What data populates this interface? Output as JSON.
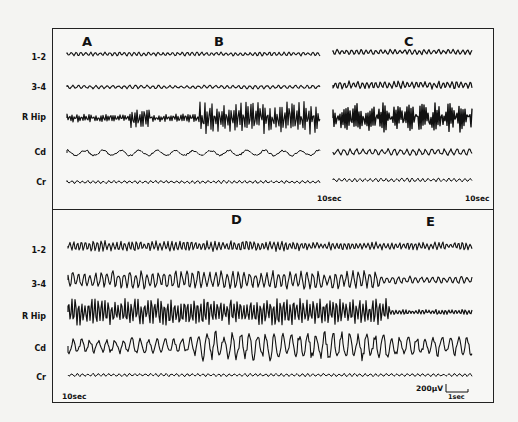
{
  "figure": {
    "top_panel": {
      "section_labels": [
        "A",
        "B",
        "C"
      ],
      "channels": [
        "1-2",
        "3-4",
        "R Hip",
        "Cd",
        "Cr"
      ],
      "time_marks": [
        "10sec",
        "10sec"
      ]
    },
    "bottom_panel": {
      "section_labels": [
        "D",
        "E"
      ],
      "channels": [
        "1-2",
        "3-4",
        "R Hip",
        "Cd",
        "Cr"
      ],
      "time_mark": "10sec",
      "calibration": {
        "amplitude": "200µV",
        "time": "1sec"
      }
    }
  }
}
